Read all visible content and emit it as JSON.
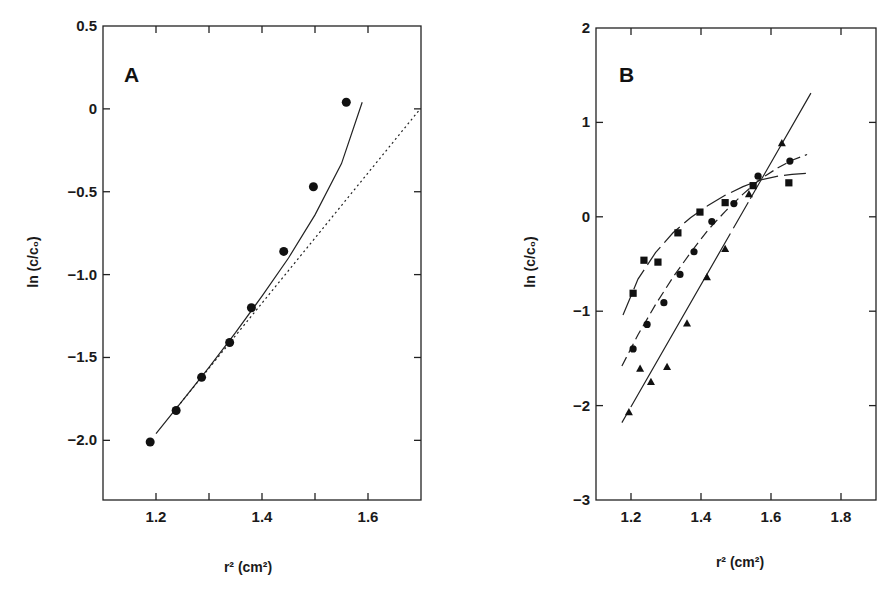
{
  "chart_data": [
    {
      "type": "scatter",
      "panel": "A",
      "title": "",
      "xlabel": "r² (cm²)",
      "ylabel": "ln (c/c₀)",
      "xlim": [
        1.1,
        1.7
      ],
      "ylim": [
        -2.36,
        0.5
      ],
      "xticks": [
        1.2,
        1.3,
        1.4,
        1.5,
        1.6
      ],
      "xtick_labels": [
        "1.2",
        "",
        "1.4",
        "",
        "1.6"
      ],
      "yticks": [
        0.5,
        0,
        -0.5,
        -1.0,
        -1.5,
        -2.0
      ],
      "ytick_labels": [
        "0.5",
        "0",
        "-0.5",
        "-1.0",
        "-1.5",
        "-2.0"
      ],
      "grid": false,
      "series": [
        {
          "name": "data",
          "marker": "circle",
          "x": [
            1.189,
            1.238,
            1.286,
            1.339,
            1.38,
            1.441,
            1.497,
            1.559
          ],
          "y": [
            -2.01,
            -1.82,
            -1.62,
            -1.41,
            -1.2,
            -0.86,
            -0.47,
            0.04
          ]
        }
      ],
      "lines": [
        {
          "name": "fit-curve",
          "style": "solid",
          "x": [
            1.2,
            1.25,
            1.3,
            1.35,
            1.4,
            1.45,
            1.5,
            1.55,
            1.589
          ],
          "y": [
            -1.96,
            -1.76,
            -1.56,
            -1.35,
            -1.13,
            -0.9,
            -0.64,
            -0.33,
            0.04
          ]
        },
        {
          "name": "linear-reference",
          "style": "dotted",
          "x": [
            1.24,
            1.696
          ],
          "y": [
            -1.8,
            -0.01
          ]
        }
      ]
    },
    {
      "type": "scatter",
      "panel": "B",
      "title": "",
      "xlabel": "r² (cm²)",
      "ylabel": "ln (c/c₀)",
      "xlim": [
        1.1,
        1.9
      ],
      "ylim": [
        -3,
        2
      ],
      "xticks": [
        1.2,
        1.4,
        1.6,
        1.8
      ],
      "xtick_labels": [
        "1.2",
        "1.4",
        "1.6",
        "1.8"
      ],
      "yticks": [
        2,
        1,
        0,
        -1,
        -2,
        -3
      ],
      "ytick_labels": [
        "2",
        "1",
        "0",
        "-1",
        "-2",
        "-3"
      ],
      "grid": false,
      "series": [
        {
          "name": "squares",
          "marker": "square",
          "x": [
            1.206,
            1.237,
            1.277,
            1.334,
            1.397,
            1.469,
            1.549,
            1.651
          ],
          "y": [
            -0.81,
            -0.46,
            -0.48,
            -0.17,
            0.05,
            0.15,
            0.33,
            0.36
          ]
        },
        {
          "name": "circles",
          "marker": "circle",
          "x": [
            1.206,
            1.246,
            1.294,
            1.34,
            1.38,
            1.431,
            1.494,
            1.563,
            1.654
          ],
          "y": [
            -1.4,
            -1.14,
            -0.91,
            -0.61,
            -0.37,
            -0.05,
            0.14,
            0.43,
            0.59
          ]
        },
        {
          "name": "triangles",
          "marker": "triangle",
          "x": [
            1.194,
            1.226,
            1.257,
            1.303,
            1.36,
            1.417,
            1.469,
            1.537,
            1.631
          ],
          "y": [
            -2.07,
            -1.61,
            -1.75,
            -1.59,
            -1.13,
            -0.64,
            -0.34,
            0.24,
            0.78
          ]
        }
      ],
      "lines": [
        {
          "name": "squares-fit",
          "style": "dashed-long",
          "x": [
            1.177,
            1.22,
            1.27,
            1.32,
            1.37,
            1.42,
            1.47,
            1.52,
            1.57,
            1.62,
            1.66,
            1.703
          ],
          "y": [
            -1.04,
            -0.66,
            -0.38,
            -0.17,
            -0.01,
            0.12,
            0.23,
            0.32,
            0.39,
            0.43,
            0.45,
            0.46
          ]
        },
        {
          "name": "circles-fit",
          "style": "dashed",
          "x": [
            1.174,
            1.22,
            1.27,
            1.32,
            1.37,
            1.42,
            1.47,
            1.52,
            1.57,
            1.62,
            1.66,
            1.703
          ],
          "y": [
            -1.58,
            -1.25,
            -0.93,
            -0.64,
            -0.38,
            -0.14,
            0.06,
            0.24,
            0.4,
            0.52,
            0.6,
            0.66
          ]
        },
        {
          "name": "triangles-fit",
          "style": "solid-dashed-ends",
          "x": [
            1.174,
            1.714
          ],
          "y": [
            -2.18,
            1.31
          ]
        }
      ]
    }
  ],
  "panels": {
    "A": {
      "letter": "A",
      "xlabel": "r² (cm²)",
      "ylabel": "ln (c/c₀)"
    },
    "B": {
      "letter": "B",
      "xlabel": "r² (cm²)",
      "ylabel": "ln (c/c₀)"
    }
  },
  "colors": {
    "ink": "#1a1a1a",
    "background": "#ffffff"
  }
}
